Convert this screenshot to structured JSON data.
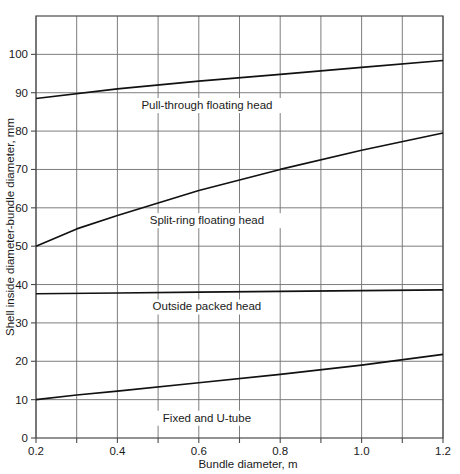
{
  "chart_data": {
    "type": "line",
    "title": "",
    "xlabel": "Bundle diameter, m",
    "ylabel": "Shell inside diameter-bundle diameter, mm",
    "xlim": [
      0.2,
      1.2
    ],
    "ylim": [
      0,
      110
    ],
    "grid": true,
    "legend_position": "inline-annotations",
    "x_ticks": [
      0.2,
      0.3,
      0.4,
      0.5,
      0.6,
      0.7,
      0.8,
      0.9,
      1.0,
      1.1,
      1.2
    ],
    "x_tick_labels": [
      "0.2",
      "",
      "0.4",
      "",
      "0.6",
      "",
      "0.8",
      "",
      "1.0",
      "",
      "1.2"
    ],
    "y_ticks": [
      0,
      10,
      20,
      30,
      40,
      50,
      60,
      70,
      80,
      90,
      100,
      110
    ],
    "y_tick_labels": [
      "0",
      "10",
      "20",
      "30",
      "40",
      "50",
      "60",
      "70",
      "80",
      "90",
      "100",
      ""
    ],
    "series": [
      {
        "name": "Pull-through floating head",
        "x": [
          0.2,
          0.4,
          0.6,
          0.8,
          1.0,
          1.2
        ],
        "values": [
          88.5,
          91.0,
          93.0,
          94.8,
          96.6,
          98.4
        ]
      },
      {
        "name": "Split-ring floating head",
        "x": [
          0.2,
          0.3,
          0.4,
          0.6,
          0.8,
          1.0,
          1.2
        ],
        "values": [
          50.0,
          54.5,
          58.0,
          64.5,
          70.0,
          75.0,
          79.5
        ]
      },
      {
        "name": "Outside packed head",
        "x": [
          0.2,
          0.4,
          0.6,
          0.8,
          1.0,
          1.2
        ],
        "values": [
          37.6,
          37.8,
          38.0,
          38.2,
          38.4,
          38.6
        ]
      },
      {
        "name": "Fixed and U-tube",
        "x": [
          0.2,
          0.3,
          0.4,
          0.6,
          0.8,
          1.0,
          1.2
        ],
        "values": [
          10.0,
          11.2,
          12.2,
          14.4,
          16.6,
          19.0,
          21.8
        ]
      }
    ],
    "annotations": [
      {
        "text": "Pull-through floating head",
        "x": 0.62,
        "y": 86.0
      },
      {
        "text": "Split-ring floating head",
        "x": 0.62,
        "y": 56.0
      },
      {
        "text": "Outside packed head",
        "x": 0.62,
        "y": 33.5
      },
      {
        "text": "Fixed and U-tube",
        "x": 0.62,
        "y": 4.5
      }
    ],
    "colors": {
      "line": "#111111",
      "grid": "#6f6f6f",
      "frame": "#4a4a4a",
      "background": "#ffffff",
      "text": "#1a1a1a"
    }
  }
}
